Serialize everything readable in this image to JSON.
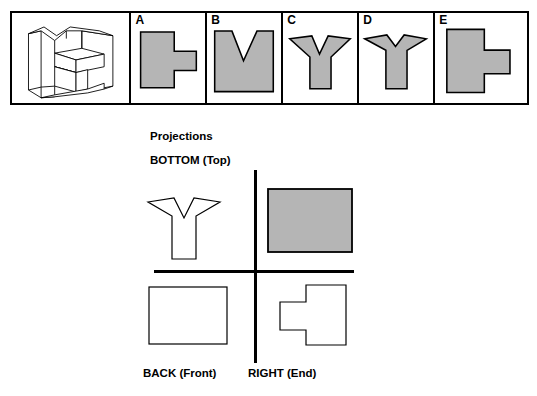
{
  "colors": {
    "fill_gray": "#b5b5b5",
    "outline": "#000000",
    "background": "#ffffff",
    "white_fill": "#ffffff"
  },
  "answer_strip": {
    "panels": [
      {
        "label": "",
        "icon": "isometric-object-pictorial",
        "fill": "none",
        "shape": "isometric-block"
      },
      {
        "label": "A",
        "icon": "option-a-shape",
        "fill": "gray",
        "shape": "rect-with-right-tab"
      },
      {
        "label": "B",
        "icon": "option-b-shape",
        "fill": "gray",
        "shape": "square-with-v-notch"
      },
      {
        "label": "C",
        "icon": "option-c-shape",
        "fill": "gray",
        "shape": "y-shape-wide-arms"
      },
      {
        "label": "D",
        "icon": "option-d-shape",
        "fill": "gray",
        "shape": "y-shape-thin-arms"
      },
      {
        "label": "E",
        "icon": "option-e-shape",
        "fill": "gray",
        "shape": "rect-with-lower-right-tab"
      }
    ]
  },
  "projections": {
    "title": "Projections",
    "top_left_label": "BOTTOM (Top)",
    "bottom_left_label": "BACK (Front)",
    "bottom_right_label": "RIGHT (End)",
    "quadrants": [
      {
        "position": "top-left",
        "shape": "y-shape-outline",
        "fill": "white"
      },
      {
        "position": "top-right",
        "shape": "rectangle-filled",
        "fill": "gray"
      },
      {
        "position": "bottom-left",
        "shape": "rectangle-outline",
        "fill": "white"
      },
      {
        "position": "bottom-right",
        "shape": "tab-left-rect-outline",
        "fill": "white"
      }
    ]
  }
}
